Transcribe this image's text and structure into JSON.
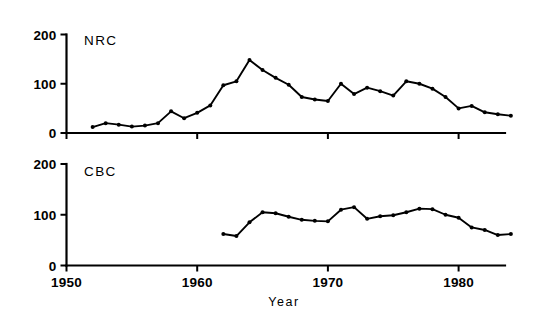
{
  "figure": {
    "background_color": "#ffffff",
    "ink_color": "#000000",
    "xlabel": "Year",
    "x_ticks": [
      1950,
      1960,
      1970,
      1980
    ],
    "x_tick_labels": [
      "1950",
      "1960",
      "1970",
      "1980"
    ],
    "y_ticks": [
      0,
      100,
      200
    ],
    "y_tick_labels": [
      "0",
      "100",
      "200"
    ]
  },
  "chart_data": [
    {
      "type": "line",
      "title": "NRC",
      "panel": "top",
      "xlabel": "",
      "ylabel": "",
      "xlim": [
        1950,
        1985
      ],
      "ylim": [
        0,
        200
      ],
      "grid": false,
      "legend": "none",
      "markers": true,
      "x": [
        1952,
        1953,
        1954,
        1955,
        1956,
        1957,
        1958,
        1959,
        1960,
        1961,
        1962,
        1963,
        1964,
        1965,
        1966,
        1967,
        1968,
        1969,
        1970,
        1971,
        1972,
        1973,
        1974,
        1975,
        1976,
        1977,
        1978,
        1979,
        1980,
        1981,
        1982,
        1983,
        1984
      ],
      "values": [
        12,
        20,
        17,
        13,
        15,
        20,
        44,
        30,
        41,
        56,
        97,
        105,
        148,
        128,
        112,
        98,
        73,
        68,
        65,
        100,
        79,
        92,
        85,
        76,
        105,
        100,
        90,
        73,
        50,
        55,
        42,
        38,
        35
      ]
    },
    {
      "type": "line",
      "title": "CBC",
      "panel": "bottom",
      "xlabel": "Year",
      "ylabel": "",
      "xlim": [
        1950,
        1985
      ],
      "ylim": [
        0,
        200
      ],
      "grid": false,
      "legend": "none",
      "markers": true,
      "x": [
        1962,
        1963,
        1964,
        1965,
        1966,
        1967,
        1968,
        1969,
        1970,
        1971,
        1972,
        1973,
        1974,
        1975,
        1976,
        1977,
        1978,
        1979,
        1980,
        1981,
        1982,
        1983,
        1984
      ],
      "values": [
        62,
        58,
        85,
        105,
        103,
        96,
        90,
        88,
        87,
        110,
        115,
        92,
        97,
        99,
        105,
        112,
        111,
        100,
        94,
        75,
        70,
        60,
        62
      ]
    }
  ]
}
